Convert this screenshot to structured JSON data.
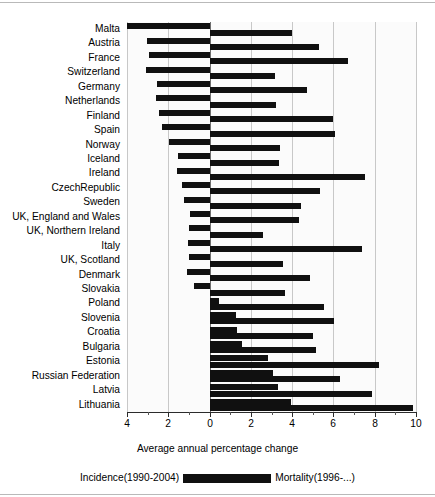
{
  "chart_data": {
    "type": "bar",
    "orientation": "horizontal",
    "title": "",
    "xlabel": "Average annual percentage change",
    "ylabel": "",
    "xlim": [
      -4,
      10
    ],
    "xticks": [
      -4,
      -2,
      0,
      2,
      4,
      6,
      8,
      10
    ],
    "xticklabels": [
      "4",
      "2",
      "0",
      "2",
      "4",
      "6",
      "8",
      "10"
    ],
    "minor_ticks": [
      -3,
      -1,
      1,
      3,
      5,
      7,
      9
    ],
    "grid": "vertical",
    "legend_position": "bottom",
    "note": "Left-hand (negative-direction) bars are Incidence(1990-2004); right-hand (positive-direction) bars are Mortality(1996-...). Both axes are plotted as magnitudes so the left tick labels are shown unsigned.",
    "categories": [
      "Malta",
      "Austria",
      "France",
      "Switzerland",
      "Germany",
      "Netherlands",
      "Finland",
      "Spain",
      "Norway",
      "Iceland",
      "Ireland",
      "CzechRepublic",
      "Sweden",
      "UK, England and Wales",
      "UK, Northern Ireland",
      "Italy",
      "UK, Scotland",
      "Denmark",
      "Slovakia",
      "Poland",
      "Slovenia",
      "Croatia",
      "Bulgaria",
      "Estonia",
      "Russian Federation",
      "Latvia",
      "Lithuania"
    ],
    "series": [
      {
        "name": "Incidence(1990-2004)",
        "color": "#101010",
        "direction": "left",
        "values": [
          -4.0,
          -3.05,
          -2.95,
          -3.1,
          -2.55,
          -2.6,
          -2.45,
          -2.3,
          -1.95,
          -1.55,
          -1.6,
          -1.35,
          -1.25,
          -0.95,
          -1.0,
          -1.05,
          -1.0,
          -1.1,
          -0.75,
          0.45,
          1.3,
          1.35,
          1.55,
          2.85,
          3.05,
          3.3,
          3.95
        ]
      },
      {
        "name": "Mortality(1996-...)",
        "color": "#101010",
        "direction": "right",
        "values": [
          4.0,
          5.3,
          6.7,
          3.15,
          4.7,
          3.2,
          6.0,
          6.1,
          3.4,
          3.35,
          7.55,
          5.35,
          4.45,
          4.35,
          2.6,
          7.4,
          3.55,
          4.85,
          3.65,
          5.55,
          6.05,
          5.0,
          5.15,
          8.2,
          6.3,
          7.85,
          9.85
        ]
      }
    ]
  },
  "axis": {
    "xlabel": "Average annual percentage change",
    "tick_labels": [
      "4",
      "2",
      "0",
      "2",
      "4",
      "6",
      "8",
      "10"
    ]
  },
  "legend": {
    "left_label": "Incidence(1990-2004)",
    "right_label": "Mortality(1996-...)",
    "swatch_color": "#101010"
  }
}
